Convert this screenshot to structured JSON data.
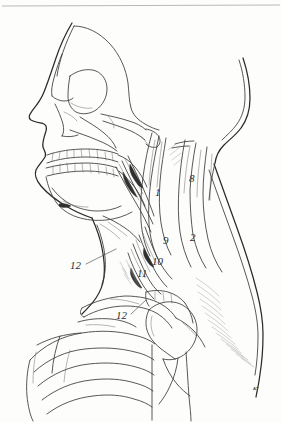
{
  "figure": {
    "style": "pen-and-ink line drawing",
    "background_color": "#fdfdfc",
    "ink_color": "#3a3a3a",
    "width": 282,
    "height": 422,
    "signature": "AT"
  },
  "frame": {
    "top_rule": true
  },
  "labels": [
    {
      "id": "label-1",
      "text": "1",
      "x": 155,
      "y": 196,
      "leader": false
    },
    {
      "id": "label-8",
      "text": "8",
      "x": 189,
      "y": 182,
      "leader": false
    },
    {
      "id": "label-2",
      "text": "2",
      "x": 190,
      "y": 241,
      "leader": false
    },
    {
      "id": "label-9",
      "text": "9",
      "x": 163,
      "y": 244,
      "leader": false
    },
    {
      "id": "label-10",
      "text": "10",
      "x": 152,
      "y": 265,
      "leader": false
    },
    {
      "id": "label-11",
      "text": "11",
      "x": 139,
      "y": 277,
      "leader": false
    },
    {
      "id": "label-12a",
      "text": "12",
      "x": 70,
      "y": 269,
      "leader": true
    },
    {
      "id": "label-12b",
      "text": "12",
      "x": 116,
      "y": 319,
      "leader": true
    }
  ],
  "leaders": [
    {
      "id": "leader-12a",
      "x1": 86,
      "y1": 264,
      "x2": 116,
      "y2": 249
    },
    {
      "id": "leader-12b",
      "x1": 131,
      "y1": 314,
      "x2": 146,
      "y2": 300
    }
  ],
  "regions": [
    {
      "id": "cranium",
      "name": "cranial vault profile"
    },
    {
      "id": "facial-profile",
      "name": "soft tissue facial profile"
    },
    {
      "id": "orbit",
      "name": "orbital cavity"
    },
    {
      "id": "nasal-aperture",
      "name": "nasal aperture"
    },
    {
      "id": "zygomatic-arch",
      "name": "zygomatic arch"
    },
    {
      "id": "maxilla-teeth",
      "name": "maxillary dentition"
    },
    {
      "id": "mandible-teeth",
      "name": "mandibular dentition"
    },
    {
      "id": "mandible",
      "name": "mandible body and ramus"
    },
    {
      "id": "sternocleidomastoid",
      "name": "sternocleidomastoid muscle"
    },
    {
      "id": "scalene-group",
      "name": "scalene muscle group"
    },
    {
      "id": "trapezius",
      "name": "trapezius muscle"
    },
    {
      "id": "clavicle",
      "name": "clavicle"
    },
    {
      "id": "scapula-acromion",
      "name": "acromion and scapular spine"
    },
    {
      "id": "humeral-head",
      "name": "head of humerus"
    },
    {
      "id": "ribs",
      "name": "rib cage"
    },
    {
      "id": "deltoid",
      "name": "deltoid contour"
    }
  ]
}
